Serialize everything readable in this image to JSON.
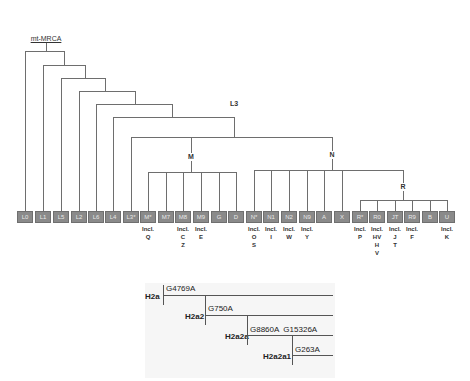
{
  "tree": {
    "root_label": "mt-MRCA",
    "internal_nodes": {
      "L3": "L3",
      "M": "M",
      "N": "N",
      "R": "R"
    },
    "incl_prefix": "Incl.",
    "leaves": [
      {
        "id": "L0",
        "x": 25,
        "incl": []
      },
      {
        "id": "L1",
        "x": 43,
        "incl": []
      },
      {
        "id": "L5",
        "x": 61,
        "incl": []
      },
      {
        "id": "L2",
        "x": 79,
        "incl": []
      },
      {
        "id": "L6",
        "x": 96,
        "incl": []
      },
      {
        "id": "L4",
        "x": 113,
        "incl": []
      },
      {
        "id": "L3*",
        "x": 131,
        "incl": []
      },
      {
        "id": "M*",
        "x": 148,
        "incl": [
          "Q"
        ]
      },
      {
        "id": "M7",
        "x": 166,
        "incl": []
      },
      {
        "id": "M8",
        "x": 183,
        "incl": [
          "C",
          "Z"
        ]
      },
      {
        "id": "M9",
        "x": 201,
        "incl": [
          "E"
        ]
      },
      {
        "id": "G",
        "x": 219,
        "incl": []
      },
      {
        "id": "D",
        "x": 236,
        "incl": []
      },
      {
        "id": "N*",
        "x": 254,
        "incl": [
          "O",
          "S"
        ]
      },
      {
        "id": "N1",
        "x": 271,
        "incl": [
          "I"
        ]
      },
      {
        "id": "N2",
        "x": 289,
        "incl": [
          "W"
        ]
      },
      {
        "id": "N9",
        "x": 307,
        "incl": [
          "Y"
        ]
      },
      {
        "id": "A",
        "x": 324,
        "incl": []
      },
      {
        "id": "X",
        "x": 342,
        "incl": []
      },
      {
        "id": "R*",
        "x": 360,
        "incl": [
          "P"
        ]
      },
      {
        "id": "R0",
        "x": 377,
        "incl": [
          "HV",
          "H",
          "V"
        ]
      },
      {
        "id": "JT",
        "x": 395,
        "incl": [
          "J",
          "T"
        ]
      },
      {
        "id": "R9",
        "x": 412,
        "incl": [
          "F"
        ]
      },
      {
        "id": "B",
        "x": 430,
        "incl": []
      },
      {
        "id": "U",
        "x": 447,
        "incl": [
          "K"
        ]
      }
    ]
  },
  "subtree": {
    "nodes": [
      {
        "label": "H2a",
        "mutations": "G4769A"
      },
      {
        "label": "H2a2",
        "mutations": "G750A"
      },
      {
        "label": "H2a2a",
        "mutations": "G8860A  G15326A"
      },
      {
        "label": "H2a2a1",
        "mutations": "G263A"
      }
    ]
  },
  "colors": {
    "line": "#6e6e6e",
    "box_fill": "#8a8a8a",
    "box_text": "#e8e8e8",
    "label_text": "#333333"
  }
}
